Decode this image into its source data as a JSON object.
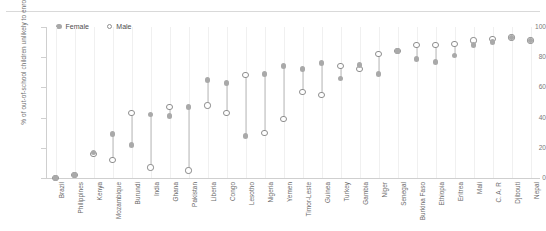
{
  "chart_data": {
    "type": "scatter",
    "title": "",
    "xlabel": "",
    "ylabel": "% of out-of-school children unlikely to enrol",
    "ylim": [
      0,
      100
    ],
    "yticks": [
      0,
      20,
      40,
      60,
      80,
      100
    ],
    "grid": "vertical",
    "legend_position": "top-left",
    "legend": [
      "Female",
      "Male"
    ],
    "categories": [
      "Brazil",
      "Philippines",
      "Kenya",
      "Mozambique",
      "Burundi",
      "India",
      "Ghana",
      "Pakistan",
      "Liberia",
      "Congo",
      "Lesotho",
      "Nigeria",
      "Yemen",
      "Timor-Leste",
      "Guinea",
      "Turkey",
      "Gambia",
      "Niger",
      "Senegal",
      "Burkina Faso",
      "Ethiopia",
      "Eritrea",
      "Mali",
      "C. A. R",
      "Djibouti",
      "Nepal"
    ],
    "series": [
      {
        "name": "Female",
        "marker": "filled-circle",
        "color": "#a9a9a9",
        "values": [
          0,
          2,
          17,
          29,
          22,
          42,
          41,
          47,
          65,
          63,
          28,
          69,
          74,
          72,
          76,
          66,
          75,
          69,
          84,
          79,
          77,
          81,
          88,
          90,
          93,
          91
        ]
      },
      {
        "name": "Male",
        "marker": "open-circle",
        "color": "#8d8d8d",
        "values": [
          0,
          2,
          16,
          12,
          43,
          7,
          47,
          5,
          48,
          43,
          68,
          30,
          39,
          57,
          55,
          74,
          72,
          82,
          84,
          88,
          88,
          89,
          91,
          92,
          93,
          91
        ]
      }
    ]
  }
}
